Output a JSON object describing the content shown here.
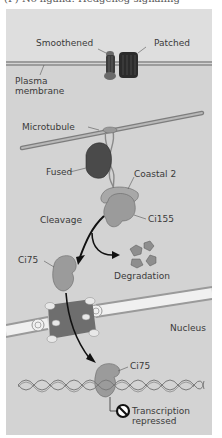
{
  "caption": "(F) No ligand: Hedgehog signaling",
  "labels": {
    "smoothened": "Smoothened",
    "patched": "Patched",
    "plasma_membrane_1": "Plasma",
    "plasma_membrane_2": "membrane",
    "microtubule": "Microtubule",
    "fused": "Fused",
    "coastal2": "Coastal 2",
    "ci155": "Ci155",
    "cleavage": "Cleavage",
    "ci75_cyto": "Ci75",
    "degradation": "Degradation",
    "nucleus": "Nucleus",
    "ci75_nuc": "Ci75",
    "transcription_1": "Transcription",
    "transcription_2": "repressed"
  },
  "colors": {
    "background": "#d3d3d3",
    "extracellular": "#dcdcdc",
    "membrane": "#8a8a8a",
    "fused": "#4a4a4a",
    "smoothened": "#5a5a5a",
    "patched": "#2e2e2e",
    "ci": "#9a9a9a",
    "nuclear_pore": "#6e6e6e"
  }
}
